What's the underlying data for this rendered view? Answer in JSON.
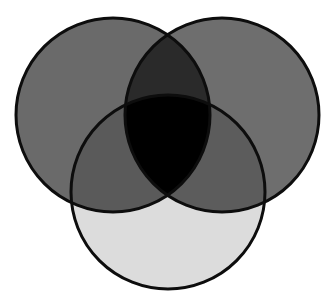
{
  "figure": {
    "kind": "venn-diagram",
    "title": "",
    "caption": "",
    "width": 335,
    "height": 304,
    "background_color": "#ffffff",
    "stroke_color": "#0d0d0d",
    "stroke_width": 3,
    "set_count": 3,
    "labels_visible": false,
    "counts_visible": false
  },
  "chart_data": {
    "type": "venn",
    "title": "",
    "xlabel": "",
    "ylabel": "",
    "legend_position": "none",
    "grid": false,
    "sets": [
      {
        "id": "left",
        "name": "",
        "fill": "#6a6a6a",
        "cx": 113,
        "cy": 115,
        "r": 97
      },
      {
        "id": "right",
        "name": "",
        "fill": "#6e6e6e",
        "cx": 222,
        "cy": 115,
        "r": 97
      },
      {
        "id": "bottom",
        "name": "",
        "fill": "#dcdcdc",
        "cx": 168,
        "cy": 192,
        "r": 97
      }
    ],
    "regions": [
      {
        "id": "left-only",
        "members": [
          "left"
        ],
        "fill": "#6a6a6a",
        "label": ""
      },
      {
        "id": "right-only",
        "members": [
          "right"
        ],
        "fill": "#6e6e6e",
        "label": ""
      },
      {
        "id": "bottom-only",
        "members": [
          "bottom"
        ],
        "fill": "#dcdcdc",
        "label": ""
      },
      {
        "id": "left-right",
        "members": [
          "left",
          "right"
        ],
        "fill": "#2a2a2a",
        "label": ""
      },
      {
        "id": "left-bottom",
        "members": [
          "left",
          "bottom"
        ],
        "fill": "#5a5a5a",
        "label": ""
      },
      {
        "id": "right-bottom",
        "members": [
          "right",
          "bottom"
        ],
        "fill": "#5c5c5c",
        "label": ""
      },
      {
        "id": "left-right-bottom",
        "members": [
          "left",
          "right",
          "bottom"
        ],
        "fill": "#000000",
        "label": ""
      }
    ]
  }
}
